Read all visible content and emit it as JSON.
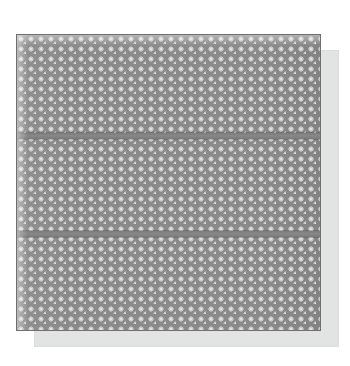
{
  "canvas": {
    "width": 350,
    "height": 366,
    "background_color": "#ffffff"
  },
  "object": {
    "name": "perforated-metal-plate",
    "description": "Perforated sheet metal panel with staggered round holes",
    "shape": "square",
    "orientation": "front-facing flat"
  },
  "plate": {
    "x": 16,
    "y": 34,
    "width": 305,
    "height": 297,
    "body_color": "#8a8a8a",
    "edge_color": "#6f6f6f",
    "hole_color": "#c9c9c9",
    "hole_edge_color": "#ffffff",
    "hole_shadow_color": "#6e6e6e"
  },
  "perforation": {
    "pattern": "staggered-hexagonal",
    "hole_shape": "circle",
    "hole_diameter_px": 7,
    "pitch_x_px": 10,
    "pitch_y_px": 10,
    "stagger_offset_px": 5,
    "columns": 31,
    "rows": 30,
    "open_area_label": "60%"
  },
  "ribs": {
    "count": 2,
    "color": "#7b7b7b",
    "thickness_px": 6,
    "items": [
      {
        "label": "upper-rib",
        "y": 133,
        "height": 6
      },
      {
        "label": "lower-rib",
        "y": 231,
        "height": 6
      }
    ]
  },
  "sections": [
    {
      "label": "top-section",
      "y": 34,
      "height": 99
    },
    {
      "label": "middle-section",
      "y": 139,
      "height": 92
    },
    {
      "label": "bottom-section",
      "y": 237,
      "height": 94
    }
  ],
  "shadow": {
    "x": 34,
    "y": 50,
    "width": 305,
    "height": 297,
    "color": "#e2e4e3",
    "border_color": "#dcdedd",
    "offset_x": 18,
    "offset_y": 16
  },
  "highlights": {
    "top_edge_label": "bright-open-holes-top-row",
    "left_edge_label": "bright-open-holes-left-column"
  },
  "alt_text": "A square perforated metal plate with a staggered grid of round holes, divided into three horizontal sections by two solid ribs, casting a soft gray shadow to the lower right."
}
